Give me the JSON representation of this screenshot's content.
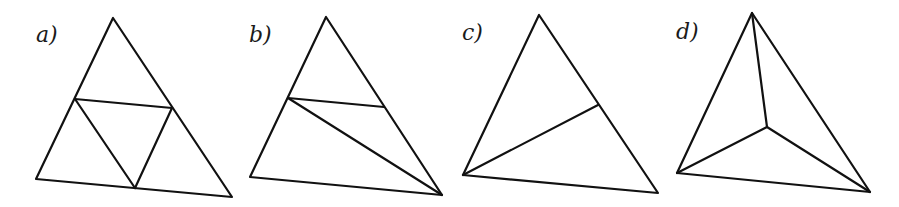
{
  "figures": [
    {
      "label": "a)",
      "label_pos": [
        36,
        42
      ],
      "triangle": [
        [
          113,
          18
        ],
        [
          36,
          179
        ],
        [
          232,
          197
        ]
      ],
      "segments": [
        [
          [
            75,
            99
          ],
          [
            172,
            108
          ]
        ],
        [
          [
            75,
            99
          ],
          [
            135,
            188
          ]
        ],
        [
          [
            172,
            108
          ],
          [
            135,
            188
          ]
        ]
      ]
    },
    {
      "label": "b)",
      "label_pos": [
        249,
        42
      ],
      "triangle": [
        [
          326,
          17
        ],
        [
          250,
          177
        ],
        [
          442,
          195
        ]
      ],
      "segments": [
        [
          [
            288,
            98
          ],
          [
            384,
            107
          ]
        ],
        [
          [
            288,
            98
          ],
          [
            442,
            195
          ]
        ]
      ]
    },
    {
      "label": "c)",
      "label_pos": [
        462,
        40
      ],
      "triangle": [
        [
          539,
          15
        ],
        [
          463,
          175
        ],
        [
          658,
          193
        ]
      ],
      "segments": [
        [
          [
            463,
            175
          ],
          [
            598,
            105
          ]
        ]
      ]
    },
    {
      "label": "d)",
      "label_pos": [
        676,
        39
      ],
      "triangle": [
        [
          752,
          13
        ],
        [
          677,
          173
        ],
        [
          870,
          192
        ]
      ],
      "segments": [
        [
          [
            752,
            13
          ],
          [
            767,
            127
          ]
        ],
        [
          [
            677,
            173
          ],
          [
            767,
            127
          ]
        ],
        [
          [
            870,
            192
          ],
          [
            767,
            127
          ]
        ]
      ]
    }
  ]
}
